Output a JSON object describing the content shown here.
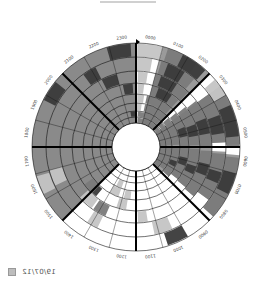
{
  "title_bar": "",
  "legend": {
    "label": "19/07/12",
    "swatch_color": "#bdbdbd"
  },
  "chart_data": {
    "type": "heatmap",
    "layout": "polar-24h-clock",
    "title": "",
    "orientation": "0000 at top, clockwise",
    "center": [
      136,
      147
    ],
    "outer_radius": 104,
    "inner_radius": 24,
    "ring_radii": [
      104,
      90,
      76,
      64,
      53,
      44,
      36,
      30,
      24
    ],
    "rings": 8,
    "hour_labels": [
      "0000",
      "0100",
      "0200",
      "0300",
      "0400",
      "0500",
      "0600",
      "0700",
      "0800",
      "0900",
      "1000",
      "1100",
      "1200",
      "1300",
      "1400",
      "1500",
      "1600",
      "1700",
      "1800",
      "1900",
      "2000",
      "2100",
      "2200",
      "2300"
    ],
    "major_dividers_hours": [
      0,
      3,
      6,
      9,
      12,
      15,
      18,
      21
    ],
    "colors": {
      "background_fill": "#8a8a8a",
      "dark": "#3a3a3a",
      "mid": "#7a7a7a",
      "light": "#c4c4c4",
      "empty": "#ffffff",
      "grid": "#111111"
    },
    "shaded_background_sectors": [
      {
        "from_hour": 15,
        "to_hour": 24,
        "color": "background_fill"
      },
      {
        "from_hour": 1,
        "to_hour": 12,
        "color": "mid_partial"
      }
    ],
    "segments": [
      {
        "ring": 0,
        "from": 22.9,
        "to": 23.8,
        "shade": "dark"
      },
      {
        "ring": 0,
        "from": 1.2,
        "to": 2.4,
        "shade": "mid"
      },
      {
        "ring": 0,
        "from": 1.8,
        "to": 2.8,
        "shade": "dark"
      },
      {
        "ring": 0,
        "from": 3.3,
        "to": 4.0,
        "shade": "light"
      },
      {
        "ring": 0,
        "from": 4.0,
        "to": 6.0,
        "shade": "mid"
      },
      {
        "ring": 0,
        "from": 4.4,
        "to": 5.6,
        "shade": "dark"
      },
      {
        "ring": 0,
        "from": 6.4,
        "to": 8.8,
        "shade": "mid"
      },
      {
        "ring": 0,
        "from": 7.0,
        "to": 7.8,
        "shade": "dark"
      },
      {
        "ring": 0,
        "from": 10.0,
        "to": 10.8,
        "shade": "dark"
      },
      {
        "ring": 0,
        "from": 19.8,
        "to": 20.6,
        "shade": "dark"
      },
      {
        "ring": 0,
        "from": 0.05,
        "to": 1.0,
        "shade": "light"
      },
      {
        "ring": 1,
        "from": 0.05,
        "to": 0.7,
        "shade": "light"
      },
      {
        "ring": 1,
        "from": 1.1,
        "to": 2.7,
        "shade": "mid"
      },
      {
        "ring": 1,
        "from": 1.4,
        "to": 2.2,
        "shade": "dark"
      },
      {
        "ring": 1,
        "from": 3.6,
        "to": 5.8,
        "shade": "mid"
      },
      {
        "ring": 1,
        "from": 4.6,
        "to": 5.4,
        "shade": "dark"
      },
      {
        "ring": 1,
        "from": 6.3,
        "to": 8.4,
        "shade": "mid"
      },
      {
        "ring": 1,
        "from": 7.1,
        "to": 7.6,
        "shade": "dark"
      },
      {
        "ring": 1,
        "from": 10.4,
        "to": 11.2,
        "shade": "light"
      },
      {
        "ring": 1,
        "from": 21.6,
        "to": 22.2,
        "shade": "dark"
      },
      {
        "ring": 1,
        "from": 13.7,
        "to": 14.2,
        "shade": "light"
      },
      {
        "ring": 2,
        "from": 0.1,
        "to": 0.6,
        "shade": "light"
      },
      {
        "ring": 2,
        "from": 1.0,
        "to": 2.9,
        "shade": "mid"
      },
      {
        "ring": 2,
        "from": 1.3,
        "to": 2.2,
        "shade": "dark"
      },
      {
        "ring": 2,
        "from": 3.5,
        "to": 6.0,
        "shade": "mid"
      },
      {
        "ring": 2,
        "from": 4.5,
        "to": 5.3,
        "shade": "dark"
      },
      {
        "ring": 2,
        "from": 6.2,
        "to": 8.7,
        "shade": "mid"
      },
      {
        "ring": 2,
        "from": 6.9,
        "to": 7.5,
        "shade": "dark"
      },
      {
        "ring": 2,
        "from": 22.2,
        "to": 23.0,
        "shade": "dark"
      },
      {
        "ring": 2,
        "from": 13.6,
        "to": 14.3,
        "shade": "mid"
      },
      {
        "ring": 2,
        "from": 11.4,
        "to": 11.9,
        "shade": "light"
      },
      {
        "ring": 3,
        "from": 0.1,
        "to": 0.5,
        "shade": "light"
      },
      {
        "ring": 3,
        "from": 1.0,
        "to": 2.8,
        "shade": "mid"
      },
      {
        "ring": 3,
        "from": 1.4,
        "to": 2.3,
        "shade": "dark"
      },
      {
        "ring": 3,
        "from": 3.4,
        "to": 5.9,
        "shade": "mid"
      },
      {
        "ring": 3,
        "from": 4.6,
        "to": 5.3,
        "shade": "dark"
      },
      {
        "ring": 3,
        "from": 6.1,
        "to": 8.6,
        "shade": "mid"
      },
      {
        "ring": 3,
        "from": 7.2,
        "to": 7.7,
        "shade": "dark"
      },
      {
        "ring": 3,
        "from": 23.2,
        "to": 23.8,
        "shade": "dark"
      },
      {
        "ring": 3,
        "from": 12.6,
        "to": 13.2,
        "shade": "light"
      },
      {
        "ring": 3,
        "from": 14.6,
        "to": 15.0,
        "shade": "dark"
      },
      {
        "ring": 4,
        "from": 0.1,
        "to": 0.6,
        "shade": "light"
      },
      {
        "ring": 4,
        "from": 0.8,
        "to": 2.8,
        "shade": "mid"
      },
      {
        "ring": 4,
        "from": 3.3,
        "to": 6.0,
        "shade": "mid"
      },
      {
        "ring": 4,
        "from": 4.5,
        "to": 5.2,
        "shade": "dark"
      },
      {
        "ring": 4,
        "from": 6.0,
        "to": 8.5,
        "shade": "mid"
      },
      {
        "ring": 4,
        "from": 6.8,
        "to": 7.4,
        "shade": "dark"
      },
      {
        "ring": 4,
        "from": 12.4,
        "to": 12.9,
        "shade": "light"
      },
      {
        "ring": 5,
        "from": 0.1,
        "to": 0.5,
        "shade": "light"
      },
      {
        "ring": 5,
        "from": 0.8,
        "to": 2.9,
        "shade": "mid"
      },
      {
        "ring": 5,
        "from": 3.2,
        "to": 5.8,
        "shade": "mid"
      },
      {
        "ring": 5,
        "from": 6.0,
        "to": 8.8,
        "shade": "mid"
      },
      {
        "ring": 5,
        "from": 7.3,
        "to": 7.8,
        "shade": "dark"
      },
      {
        "ring": 5,
        "from": 13.3,
        "to": 13.8,
        "shade": "light"
      },
      {
        "ring": 6,
        "from": 0.2,
        "to": 2.8,
        "shade": "mid"
      },
      {
        "ring": 6,
        "from": 3.0,
        "to": 5.8,
        "shade": "mid"
      },
      {
        "ring": 6,
        "from": 6.0,
        "to": 8.6,
        "shade": "mid"
      },
      {
        "ring": 6,
        "from": 23.4,
        "to": 23.9,
        "shade": "dark"
      },
      {
        "ring": 7,
        "from": 0.2,
        "to": 2.9,
        "shade": "mid"
      },
      {
        "ring": 7,
        "from": 3.0,
        "to": 6.0,
        "shade": "mid"
      },
      {
        "ring": 7,
        "from": 6.0,
        "to": 8.8,
        "shade": "mid"
      }
    ],
    "light_blocks_afternoon": [
      {
        "ring": 1,
        "from": 16.3,
        "to": 17.0,
        "shade": "light"
      },
      {
        "ring": 3,
        "from": 14.9,
        "to": 15.6,
        "shade": "mid"
      },
      {
        "ring": 2,
        "from": 14.4,
        "to": 15.2,
        "shade": "light"
      },
      {
        "ring": 4,
        "from": 13.3,
        "to": 14.0,
        "shade": "light"
      },
      {
        "ring": 0,
        "from": 16.2,
        "to": 16.9,
        "shade": "light"
      }
    ]
  }
}
